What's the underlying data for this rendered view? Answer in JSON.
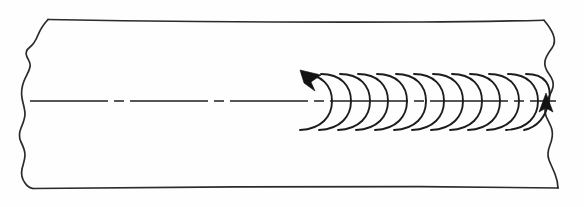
{
  "figure": {
    "title": "Shaft with helical torque indication",
    "background_color": "#fefefe",
    "line_color": "#2b2b2b",
    "accent_color": "#121212"
  },
  "shaft": {
    "label": "shaft-body",
    "top_edge_y": 20,
    "bottom_edge_y": 188,
    "left_x": 34,
    "right_x": 552
  },
  "break_lines": {
    "left_label": "left-freehand-break",
    "right_label": "right-freehand-break",
    "style": "freehand-wavy"
  },
  "center_line": {
    "label": "axis-center-line",
    "y": 101,
    "start_x": 30,
    "end_x": 556,
    "style": "long-dash-short-dash",
    "dash_pattern": "78 6 10 6"
  },
  "helix": {
    "label": "helical-spiral",
    "loop_count": 13,
    "start_x": 302,
    "end_x": 545,
    "pitch": 18.7,
    "amplitude_top_y": 72,
    "amplitude_bottom_y": 130,
    "hand": "left-hand",
    "open_side": "left"
  },
  "arrowheads": [
    {
      "label": "start-arrowhead",
      "position": "upper-left-of-first-loop",
      "x": 312,
      "y": 76,
      "direction": "up-left"
    },
    {
      "label": "end-arrowhead",
      "position": "below-centerline-at-last-loop",
      "x": 545,
      "y": 108,
      "direction": "up"
    }
  ]
}
